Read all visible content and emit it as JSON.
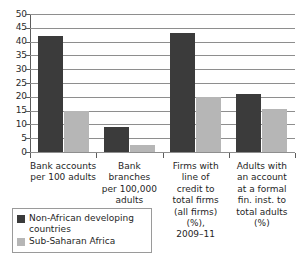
{
  "chart_data": {
    "type": "bar",
    "title": "",
    "subtitle": "",
    "xlabel": "",
    "ylabel": "",
    "ylim": [
      0,
      50
    ],
    "yticks": [
      0,
      5,
      10,
      15,
      20,
      25,
      30,
      35,
      40,
      45,
      50
    ],
    "grid": true,
    "legend_position": "bottom-left",
    "categories": [
      "Bank accounts per 100 adults",
      "Bank branches per 100,000 adults",
      "Firms with line of credit to total firms (all firms) (%), 2009–11",
      "Adults with an account at a formal fin. inst. to total adults (%)"
    ],
    "category_lines": [
      [
        "Bank accounts",
        "per 100 adults"
      ],
      [
        "Bank branches",
        "per 100,000",
        "adults"
      ],
      [
        "Firms with",
        "line of",
        "credit to",
        "total firms",
        "(all firms)",
        "(%),",
        "2009–11"
      ],
      [
        "Adults with",
        "an account",
        "at a formal",
        "fin. inst. to",
        "total adults",
        "(%)"
      ]
    ],
    "series": [
      {
        "name": "Non-African developing countries",
        "color": "#3b3b3b",
        "values": [
          42,
          9,
          43,
          21
        ]
      },
      {
        "name": "Sub-Saharan Africa",
        "color": "#b6b6b6",
        "values": [
          15,
          2.5,
          20,
          15.5
        ]
      }
    ]
  },
  "legend": {
    "entries": [
      {
        "label_line1": "Non-African developing",
        "label_line2": "countries",
        "swatch": "dark"
      },
      {
        "label_line1": "Sub-Saharan Africa",
        "label_line2": "",
        "swatch": "light"
      }
    ]
  }
}
